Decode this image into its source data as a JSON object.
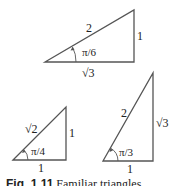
{
  "triangles": [
    {
      "name": "30-60-90",
      "angle_label": "π/6",
      "hypotenuse": "2",
      "opposite": "1",
      "adjacent": "√3"
    },
    {
      "name": "45-45-90",
      "angle_label": "π/4",
      "hypotenuse": "√2",
      "opposite": "1",
      "adjacent": "1"
    },
    {
      "name": "60-30-90",
      "angle_label": "π/3",
      "hypotenuse": "2",
      "opposite": "√3",
      "adjacent": "1"
    }
  ],
  "caption": {
    "label": "Fig. 1.11",
    "text": "Familiar triangles"
  },
  "colors": {
    "line": "#555555",
    "text": "#222222"
  }
}
